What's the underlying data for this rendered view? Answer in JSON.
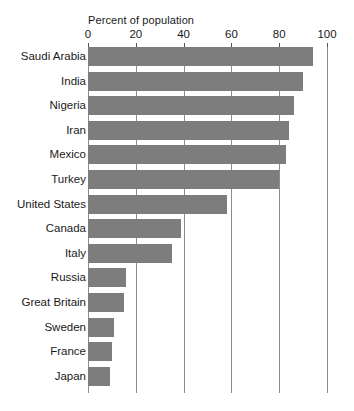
{
  "chart_data": {
    "type": "bar",
    "orientation": "horizontal",
    "title": "Percent of population",
    "xlabel": "Percent of population",
    "ylabel": "",
    "xlim": [
      0,
      100
    ],
    "xticks": [
      0,
      20,
      40,
      60,
      80,
      100
    ],
    "xtick_labels": [
      "0",
      "20",
      "40",
      "60",
      "80",
      "100"
    ],
    "grid": true,
    "grid_axis": "x",
    "legend": false,
    "legend_position": "none",
    "bar_color": "#7d7d7d",
    "gridline_color": "#8d8d8d",
    "background_color": "#ffffff",
    "categories": [
      "Saudi Arabia",
      "India",
      "Nigeria",
      "Iran",
      "Mexico",
      "Turkey",
      "United States",
      "Canada",
      "Italy",
      "Russia",
      "Great Britain",
      "Sweden",
      "France",
      "Japan"
    ],
    "values": [
      94,
      90,
      86,
      84,
      83,
      80,
      58,
      39,
      35,
      16,
      15,
      11,
      10,
      9
    ]
  }
}
